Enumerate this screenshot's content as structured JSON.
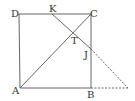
{
  "diagram": {
    "type": "geometry",
    "points": [
      {
        "id": "D",
        "label": "D",
        "x": 19,
        "y": 14,
        "lx": 11,
        "ly": 17
      },
      {
        "id": "K",
        "label": "K",
        "x": 52,
        "y": 14,
        "lx": 49,
        "ly": 12
      },
      {
        "id": "C",
        "label": "C",
        "x": 91,
        "y": 14,
        "lx": 90,
        "ly": 17
      },
      {
        "id": "T",
        "label": "T",
        "x": 73,
        "y": 33,
        "lx": 71,
        "ly": 44
      },
      {
        "id": "J",
        "label": "J",
        "x": 91,
        "y": 49,
        "lx": 84,
        "ly": 58
      },
      {
        "id": "A",
        "label": "A",
        "x": 20,
        "y": 88,
        "lx": 12,
        "ly": 94
      },
      {
        "id": "B",
        "label": "B",
        "x": 91,
        "y": 88,
        "lx": 87,
        "ly": 98
      },
      {
        "id": "E",
        "label": "",
        "x": 128,
        "y": 88
      }
    ],
    "segments": [
      {
        "from": "D",
        "to": "C",
        "style": "solid"
      },
      {
        "from": "D",
        "to": "A",
        "style": "solid"
      },
      {
        "from": "C",
        "to": "B",
        "style": "solid"
      },
      {
        "from": "A",
        "to": "B",
        "style": "solid"
      },
      {
        "from": "A",
        "to": "C",
        "style": "solid"
      },
      {
        "from": "K",
        "to": "J",
        "style": "solid"
      },
      {
        "from": "J",
        "to": "E",
        "style": "dashed"
      },
      {
        "from": "B",
        "to": "E",
        "style": "dashed"
      }
    ],
    "colors": {
      "line": "#555555",
      "text": "#333333",
      "background": "#ffffff"
    }
  }
}
